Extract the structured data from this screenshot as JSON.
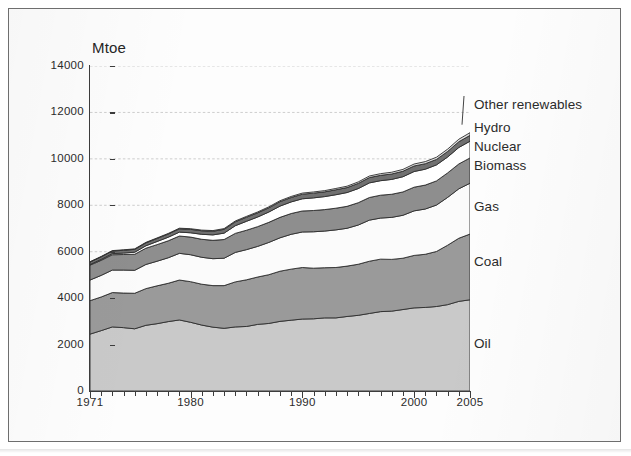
{
  "figure": {
    "unit_caption": "Mtoe"
  },
  "chart_data": {
    "type": "area",
    "title": "",
    "subtitle": "",
    "xlabel": "",
    "ylabel": "Mtoe",
    "stacked": true,
    "grid": true,
    "legend_position": "right-callout",
    "xlim": [
      1971,
      2005
    ],
    "ylim": [
      0,
      14000
    ],
    "ytick_labels": [
      "0",
      "2000",
      "4000",
      "6000",
      "8000",
      "10000",
      "12000",
      "14000"
    ],
    "ytick_values": [
      0,
      2000,
      4000,
      6000,
      8000,
      10000,
      12000,
      14000
    ],
    "xtick_labels": [
      "1971",
      "1980",
      "1990",
      "2000",
      "2005"
    ],
    "xtick_values": [
      1971,
      1980,
      1990,
      2000,
      2005
    ],
    "x": [
      1971,
      1972,
      1973,
      1974,
      1975,
      1976,
      1977,
      1978,
      1979,
      1980,
      1981,
      1982,
      1983,
      1984,
      1985,
      1986,
      1987,
      1988,
      1989,
      1990,
      1991,
      1992,
      1993,
      1994,
      1995,
      1996,
      1997,
      1998,
      1999,
      2000,
      2001,
      2002,
      2003,
      2004,
      2005
    ],
    "colors": {
      "oil": "#c9c9c9",
      "coal": "#9a9a9a",
      "gas": "#fbfbfb",
      "biomass": "#8e8e8e",
      "nuclear": "#ffffff",
      "hydro": "#707070",
      "other_renewables": "#e0e0e0",
      "outline": "#2e2e2e",
      "axis": "#3c3c3c",
      "gridline": "#b9b9b9",
      "text": "#2b2b2b"
    },
    "series": [
      {
        "name": "Oil",
        "label": "Oil",
        "color": "#c9c9c9",
        "values": [
          2450,
          2600,
          2760,
          2730,
          2680,
          2830,
          2900,
          2990,
          3060,
          2960,
          2840,
          2750,
          2700,
          2760,
          2780,
          2870,
          2910,
          3000,
          3050,
          3100,
          3110,
          3150,
          3150,
          3210,
          3260,
          3340,
          3420,
          3440,
          3510,
          3580,
          3600,
          3640,
          3720,
          3860,
          3930
        ]
      },
      {
        "name": "Coal",
        "label": "Coal",
        "color": "#9a9a9a",
        "values": [
          1440,
          1450,
          1480,
          1490,
          1530,
          1580,
          1630,
          1650,
          1720,
          1750,
          1760,
          1790,
          1840,
          1940,
          2010,
          2040,
          2100,
          2160,
          2200,
          2220,
          2180,
          2160,
          2170,
          2170,
          2200,
          2250,
          2260,
          2230,
          2210,
          2260,
          2290,
          2370,
          2560,
          2720,
          2830
        ]
      },
      {
        "name": "Gas",
        "label": "Gas",
        "color": "#fbfbfb",
        "values": [
          890,
          930,
          970,
          990,
          990,
          1040,
          1060,
          1100,
          1150,
          1160,
          1160,
          1160,
          1180,
          1270,
          1300,
          1320,
          1390,
          1440,
          1500,
          1530,
          1570,
          1580,
          1620,
          1630,
          1690,
          1770,
          1770,
          1810,
          1850,
          1920,
          1950,
          2000,
          2060,
          2130,
          2190
        ]
      },
      {
        "name": "Biomass",
        "label": "Biomass",
        "color": "#8e8e8e",
        "values": [
          640,
          650,
          660,
          670,
          690,
          700,
          715,
          730,
          745,
          760,
          775,
          790,
          805,
          820,
          835,
          850,
          865,
          880,
          895,
          905,
          915,
          925,
          935,
          945,
          960,
          975,
          985,
          995,
          1005,
          1020,
          1030,
          1040,
          1055,
          1070,
          1090
        ]
      },
      {
        "name": "Nuclear",
        "label": "Nuclear",
        "color": "#ffffff",
        "values": [
          29,
          38,
          47,
          62,
          88,
          105,
          135,
          155,
          170,
          186,
          215,
          235,
          275,
          330,
          385,
          415,
          445,
          485,
          500,
          525,
          545,
          560,
          580,
          595,
          610,
          630,
          625,
          640,
          655,
          675,
          685,
          690,
          685,
          710,
          720
        ]
      },
      {
        "name": "Hydro",
        "label": "Hydro",
        "color": "#707070",
        "values": [
          104,
          110,
          112,
          120,
          124,
          126,
          130,
          138,
          142,
          148,
          152,
          156,
          164,
          170,
          176,
          180,
          183,
          190,
          191,
          198,
          203,
          203,
          213,
          212,
          222,
          228,
          230,
          233,
          236,
          238,
          236,
          235,
          239,
          248,
          252
        ]
      },
      {
        "name": "Other renewables",
        "label": "Other renewables",
        "color": "#e0e0e0",
        "values": [
          17,
          18,
          19,
          20,
          21,
          22,
          23,
          24,
          26,
          27,
          29,
          30,
          32,
          34,
          36,
          38,
          40,
          42,
          45,
          48,
          51,
          54,
          57,
          60,
          64,
          68,
          72,
          76,
          80,
          85,
          90,
          95,
          101,
          108,
          115
        ]
      }
    ],
    "totals": {
      "1971": 5570,
      "1980": 6987,
      "1990": 8878,
      "2000": 10778,
      "2005": 12127
    },
    "callouts": [
      {
        "name": "Other renewables",
        "label": "Other renewables"
      },
      {
        "name": "Hydro",
        "label": "Hydro"
      },
      {
        "name": "Nuclear",
        "label": "Nuclear"
      },
      {
        "name": "Biomass",
        "label": "Biomass"
      },
      {
        "name": "Gas",
        "label": "Gas"
      },
      {
        "name": "Coal",
        "label": "Coal"
      },
      {
        "name": "Oil",
        "label": "Oil"
      }
    ]
  }
}
